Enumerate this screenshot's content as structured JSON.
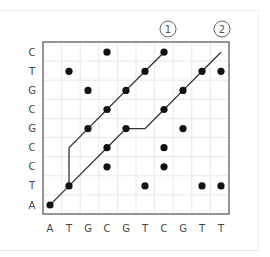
{
  "diagram": {
    "type": "dot-plot",
    "x_sequence": [
      "A",
      "T",
      "G",
      "C",
      "G",
      "T",
      "C",
      "G",
      "T",
      "T"
    ],
    "y_sequence_bottom_to_top": [
      "A",
      "T",
      "C",
      "C",
      "G",
      "C",
      "G",
      "T",
      "C"
    ],
    "annotations": [
      {
        "label": "1",
        "marks": "diagonal-path-1-end"
      },
      {
        "label": "2",
        "marks": "diagonal-path-2-end"
      }
    ],
    "dots": [
      [
        0,
        0
      ],
      [
        1,
        1
      ],
      [
        3,
        2
      ],
      [
        6,
        2
      ],
      [
        3,
        3
      ],
      [
        6,
        3
      ],
      [
        5,
        1
      ],
      [
        8,
        1
      ],
      [
        9,
        1
      ],
      [
        2,
        4
      ],
      [
        4,
        4
      ],
      [
        7,
        4
      ],
      [
        3,
        5
      ],
      [
        6,
        5
      ],
      [
        2,
        6
      ],
      [
        4,
        6
      ],
      [
        7,
        6
      ],
      [
        1,
        7
      ],
      [
        5,
        7
      ],
      [
        8,
        7
      ],
      [
        9,
        7
      ],
      [
        3,
        8
      ],
      [
        6,
        8
      ]
    ],
    "paths": [
      {
        "id": "path-1",
        "points": [
          [
            1,
            1
          ],
          [
            1,
            3
          ],
          [
            2,
            4
          ],
          [
            3,
            5
          ],
          [
            4,
            6
          ],
          [
            5,
            7
          ],
          [
            6,
            8
          ]
        ]
      },
      {
        "id": "path-2",
        "points": [
          [
            0,
            0
          ],
          [
            1,
            1
          ],
          [
            3,
            3
          ],
          [
            4,
            4
          ],
          [
            5,
            4
          ],
          [
            6,
            5
          ],
          [
            7,
            6
          ],
          [
            8,
            7
          ],
          [
            9,
            8
          ]
        ]
      }
    ],
    "colors": {
      "dot": "#111111",
      "line": "#333333",
      "grid": "#e2e2e2",
      "axis": "#555555",
      "label": "#444444"
    }
  }
}
